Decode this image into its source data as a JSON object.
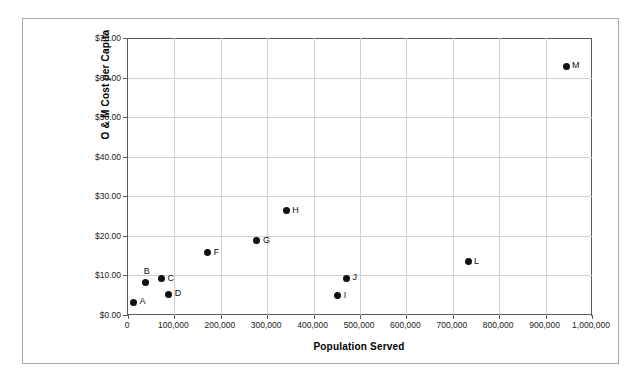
{
  "chart_data": {
    "type": "scatter",
    "title": "",
    "xlabel": "Population Served",
    "ylabel": "O & M Cost per Capita",
    "xlim": [
      0,
      1000000
    ],
    "ylim": [
      0,
      70
    ],
    "grid": true,
    "legend": "none",
    "x_tick_labels": [
      "0",
      "100,000",
      "200,000",
      "300,000",
      "400,000",
      "500,000",
      "600,000",
      "700,000",
      "800,000",
      "900,000",
      "1,000,000"
    ],
    "x_tick_values": [
      0,
      100000,
      200000,
      300000,
      400000,
      500000,
      600000,
      700000,
      800000,
      900000,
      1000000
    ],
    "y_tick_labels": [
      "$0.00",
      "$10.00",
      "$20.00",
      "$30.00",
      "$40.00",
      "$50.00",
      "$60.00",
      "$70.00"
    ],
    "y_tick_values": [
      0,
      10,
      20,
      30,
      40,
      50,
      60,
      70
    ],
    "points": [
      {
        "label": "A",
        "x": 12000,
        "y": 3.2,
        "label_side": "right"
      },
      {
        "label": "B",
        "x": 38000,
        "y": 8.3,
        "label_side": "above"
      },
      {
        "label": "C",
        "x": 72000,
        "y": 9.1,
        "label_side": "right"
      },
      {
        "label": "D",
        "x": 88000,
        "y": 5.2,
        "label_side": "right"
      },
      {
        "label": "F",
        "x": 172000,
        "y": 15.7,
        "label_side": "right"
      },
      {
        "label": "G",
        "x": 278000,
        "y": 18.8,
        "label_side": "right"
      },
      {
        "label": "H",
        "x": 341000,
        "y": 26.4,
        "label_side": "right"
      },
      {
        "label": "I",
        "x": 452000,
        "y": 4.9,
        "label_side": "right"
      },
      {
        "label": "J",
        "x": 471000,
        "y": 9.3,
        "label_side": "right"
      },
      {
        "label": "L",
        "x": 733000,
        "y": 13.4,
        "label_side": "right"
      },
      {
        "label": "M",
        "x": 944000,
        "y": 62.8,
        "label_side": "right"
      }
    ],
    "colors": {
      "marker": "#111111",
      "grid": "#d0d0d0",
      "axis": "#5a5a5a",
      "frame": "#a9a9a9",
      "text": "#000000",
      "background": "#ffffff"
    }
  }
}
